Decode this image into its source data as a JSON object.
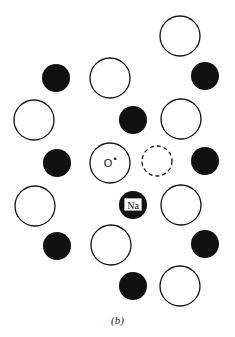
{
  "figure": {
    "caption": "(b)",
    "labels": {
      "oxygen": "O",
      "oxygen_superscript": "•",
      "sodium": "Na"
    },
    "colors": {
      "ink": "#111111",
      "background": "#ffffff"
    },
    "atoms": [
      {
        "type": "open",
        "cx": 180,
        "cy": 36,
        "r": 20
      },
      {
        "type": "filled",
        "cx": 56,
        "cy": 78,
        "r": 14
      },
      {
        "type": "open",
        "cx": 110,
        "cy": 78,
        "r": 20
      },
      {
        "type": "filled",
        "cx": 205,
        "cy": 76,
        "r": 14
      },
      {
        "type": "open",
        "cx": 34,
        "cy": 120,
        "r": 20
      },
      {
        "type": "filled",
        "cx": 133,
        "cy": 120,
        "r": 14
      },
      {
        "type": "open",
        "cx": 181,
        "cy": 119,
        "r": 20
      },
      {
        "type": "filled",
        "cx": 57,
        "cy": 163,
        "r": 14
      },
      {
        "type": "open",
        "cx": 110,
        "cy": 163,
        "r": 20,
        "label": "O•"
      },
      {
        "type": "dashed",
        "cx": 157,
        "cy": 161,
        "r": 15
      },
      {
        "type": "filled",
        "cx": 205,
        "cy": 161,
        "r": 14
      },
      {
        "type": "open",
        "cx": 35,
        "cy": 206,
        "r": 20
      },
      {
        "type": "filled",
        "cx": 133,
        "cy": 205,
        "r": 14,
        "label": "Na"
      },
      {
        "type": "open",
        "cx": 181,
        "cy": 205,
        "r": 20
      },
      {
        "type": "filled",
        "cx": 57,
        "cy": 246,
        "r": 14
      },
      {
        "type": "open",
        "cx": 111,
        "cy": 245,
        "r": 20
      },
      {
        "type": "filled",
        "cx": 205,
        "cy": 244,
        "r": 14
      },
      {
        "type": "filled",
        "cx": 133,
        "cy": 286,
        "r": 14
      },
      {
        "type": "open",
        "cx": 180,
        "cy": 286,
        "r": 20
      }
    ]
  }
}
